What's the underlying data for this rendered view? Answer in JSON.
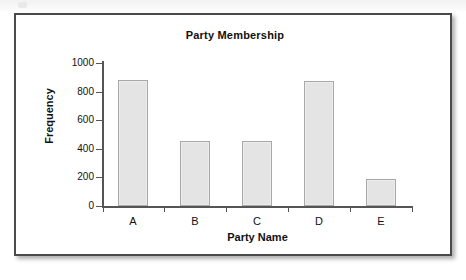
{
  "figure": {
    "title": "Party Membership",
    "frame_border_color": "#4a4a4a",
    "background_color": "#ffffff"
  },
  "chart_data": {
    "type": "bar",
    "title": "Party Membership",
    "xlabel": "Party Name",
    "ylabel": "Frequency",
    "categories": [
      "A",
      "B",
      "C",
      "D",
      "E"
    ],
    "values": [
      880,
      455,
      455,
      875,
      190
    ],
    "ylim": [
      0,
      1000
    ],
    "ytick_labels": [
      "0",
      "200",
      "400",
      "600",
      "800",
      "1000"
    ],
    "ytick_values": [
      0,
      200,
      400,
      600,
      800,
      1000
    ],
    "grid": false,
    "legend": null,
    "bar_fill_color": "#e4e4e4",
    "bar_edge_color": "#a8a8a8",
    "axis_color": "#555555"
  }
}
